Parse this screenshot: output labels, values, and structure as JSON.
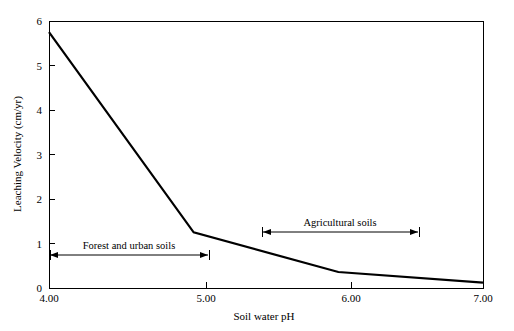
{
  "chart_data": {
    "type": "line",
    "title": "",
    "subtitle": "",
    "xlabel": "Soil water pH",
    "ylabel": "Leaching Velocity (cm/yr)",
    "xlim": [
      4.0,
      7.0
    ],
    "ylim": [
      0,
      6
    ],
    "grid": false,
    "legend": "none",
    "x_tick_labels": [
      "4.00",
      "5.00",
      "6.00",
      "7.00"
    ],
    "x_tick_values": [
      4.0,
      5.0,
      6.0,
      7.0
    ],
    "y_tick_labels": [
      "0",
      "1",
      "2",
      "3",
      "4",
      "5",
      "6"
    ],
    "y_tick_values": [
      0,
      1,
      2,
      3,
      4,
      5,
      6
    ],
    "x": [
      4.0,
      5.0,
      6.0,
      7.0
    ],
    "values": [
      5.75,
      1.25,
      0.36,
      0.12
    ],
    "series": [
      {
        "name": "Leaching velocity",
        "x": [
          4.0,
          5.0,
          6.0,
          7.0
        ],
        "values": [
          5.75,
          1.25,
          0.36,
          0.12
        ],
        "color": "#000000"
      }
    ],
    "annotations": [
      {
        "label": "Forest and urban soils",
        "x_start": 4.0,
        "x_end": 5.02,
        "y": 0.74,
        "style": "double-arrow"
      },
      {
        "label": "Agricultural soils",
        "x_start": 5.46,
        "x_end": 6.52,
        "y": 1.26,
        "style": "double-arrow"
      }
    ]
  },
  "axes": {
    "y_title": "Leaching Velocity (cm/yr)",
    "x_title": "Soil water pH",
    "y_ticks": [
      {
        "label": "6",
        "y": 21
      },
      {
        "label": "5",
        "y": 65.5
      },
      {
        "label": "4",
        "y": 110
      },
      {
        "label": "3",
        "y": 154.5
      },
      {
        "label": "2",
        "y": 199
      },
      {
        "label": "1",
        "y": 243.5
      },
      {
        "label": "0",
        "y": 288
      }
    ],
    "x_ticks": [
      {
        "label": "4.00",
        "x": 49
      },
      {
        "label": "5.00",
        "x": 206
      },
      {
        "label": "6.00",
        "x": 351
      },
      {
        "label": "7.00",
        "x": 483
      }
    ]
  },
  "annotations": {
    "forest": {
      "label": "Forest and urban soils",
      "x1": 50,
      "x2": 208,
      "y": 255,
      "text_x": 129,
      "text_y": 249
    },
    "agricultural": {
      "label": "Agricultural soils",
      "x1": 263,
      "x2": 418,
      "y": 232,
      "text_x": 340,
      "text_y": 226
    }
  },
  "colors": {
    "line": "#000000",
    "frame": "#000000",
    "background": "#ffffff"
  }
}
